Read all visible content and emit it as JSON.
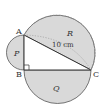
{
  "figure": {
    "type": "geometry-diagram",
    "points": {
      "A": {
        "label": "A",
        "x": 24,
        "y": 35
      },
      "B": {
        "label": "B",
        "x": 24,
        "y": 70
      },
      "C": {
        "label": "C",
        "x": 91,
        "y": 70
      }
    },
    "regions": {
      "P": {
        "label": "P"
      },
      "Q": {
        "label": "Q"
      },
      "R": {
        "label": "R"
      }
    },
    "measurements": {
      "AC": "10 cm"
    },
    "right_angle_at": "B",
    "colors": {
      "fill": "#d9d9d9",
      "stroke": "#444444",
      "dotted": "#888888",
      "background": "#ffffff"
    }
  }
}
